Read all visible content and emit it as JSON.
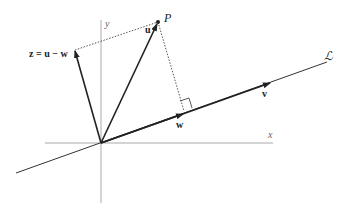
{
  "figure": {
    "labels": {
      "y_axis": "y",
      "x_axis": "x",
      "point": "P",
      "u": "u",
      "z": "z = u − w",
      "w": "w",
      "v": "v",
      "line": "ℒ"
    },
    "colors": {
      "axis": "#999999",
      "vector": "#222222",
      "line": "#333333",
      "dotted": "#555555"
    }
  }
}
